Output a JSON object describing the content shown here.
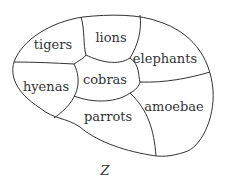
{
  "diagram": {
    "regions": [
      {
        "id": "tigers",
        "label": "tigers",
        "x": 53,
        "y": 44
      },
      {
        "id": "lions",
        "label": "lions",
        "x": 111,
        "y": 37
      },
      {
        "id": "elephants",
        "label": "elephants",
        "x": 165,
        "y": 58
      },
      {
        "id": "hyenas",
        "label": "hyenas",
        "x": 46,
        "y": 86
      },
      {
        "id": "cobras",
        "label": "cobras",
        "x": 105,
        "y": 79
      },
      {
        "id": "amoebae",
        "label": "amoebae",
        "x": 174,
        "y": 106
      },
      {
        "id": "parrots",
        "label": "parrots",
        "x": 108,
        "y": 116
      }
    ],
    "set_label": "Z",
    "stroke_color": "#333333"
  }
}
